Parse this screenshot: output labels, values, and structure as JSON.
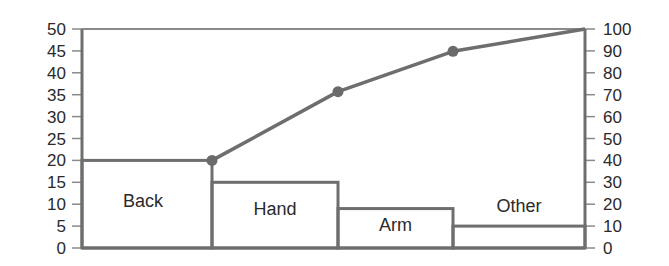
{
  "chart_data": {
    "type": "bar",
    "subtype": "pareto",
    "title": "",
    "xlabel": "",
    "ylabel": "",
    "y2label": "",
    "categories": [
      "Back",
      "Hand",
      "Arm",
      "Other"
    ],
    "series": [
      {
        "name": "Count",
        "type": "bar",
        "axis": "left",
        "values": [
          20,
          15,
          9,
          5
        ]
      },
      {
        "name": "Cumulative %",
        "type": "line",
        "axis": "right",
        "values": [
          40.8,
          71.4,
          89.8,
          100
        ]
      }
    ],
    "ylim": [
      0,
      50
    ],
    "y2lim": [
      0,
      100
    ],
    "yticks": [
      0,
      5,
      10,
      15,
      20,
      25,
      30,
      35,
      40,
      45,
      50
    ],
    "y2ticks": [
      0,
      10,
      20,
      30,
      40,
      50,
      60,
      70,
      80,
      90,
      100
    ],
    "bar_widths_relative": [
      130,
      126,
      115,
      132
    ],
    "grid": false,
    "legend": null,
    "colors": {
      "line": "#6e6e6e",
      "marker": "#6a6a6a",
      "text": "#2a2a2a",
      "background": "#ffffff"
    }
  },
  "axes": {
    "left_ticks": [
      "0",
      "5",
      "10",
      "15",
      "20",
      "25",
      "30",
      "35",
      "40",
      "45",
      "50"
    ],
    "right_ticks": [
      "0",
      "10",
      "20",
      "30",
      "40",
      "50",
      "60",
      "70",
      "80",
      "90",
      "100"
    ]
  },
  "bars": [
    {
      "label": "Back"
    },
    {
      "label": "Hand"
    },
    {
      "label": "Arm"
    },
    {
      "label": "Other"
    }
  ]
}
